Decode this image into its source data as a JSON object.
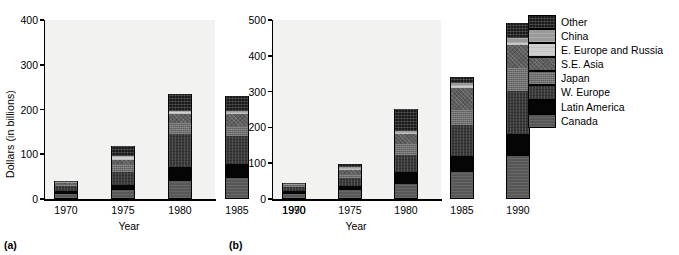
{
  "figure": {
    "background": "#ffffff",
    "panel_background": "#f2f2f0"
  },
  "legend": {
    "position": "right",
    "entries": [
      {
        "label": "Other",
        "key": "other",
        "color": "#1a1a1a"
      },
      {
        "label": "China",
        "key": "china",
        "color": "#9a9a9a"
      },
      {
        "label": "E. Europe and Russia",
        "key": "eeur",
        "color": "#cfcfcf"
      },
      {
        "label": "S.E. Asia",
        "key": "seasia",
        "color": "#5e5e5e"
      },
      {
        "label": "Japan",
        "key": "japan",
        "color": "#6e6e6e"
      },
      {
        "label": "W. Europe",
        "key": "weur",
        "color": "#3a3a3a"
      },
      {
        "label": "Latin America",
        "key": "latam",
        "color": "#050505"
      },
      {
        "label": "Canada",
        "key": "canada",
        "color": "#575757"
      }
    ]
  },
  "panels": [
    {
      "caption": "(a)"
    },
    {
      "caption": "(b)"
    }
  ],
  "chart_data": [
    {
      "type": "bar",
      "stacked": true,
      "panel": "(a)",
      "title": "",
      "xlabel": "Year",
      "ylabel": "Dollars (in billions)",
      "categories": [
        "1970",
        "1975",
        "1980",
        "1985",
        "1990"
      ],
      "yticks": [
        0,
        100,
        200,
        300,
        400
      ],
      "ylim": [
        0,
        400
      ],
      "grid": false,
      "totals": [
        38,
        116,
        233,
        227,
        390
      ],
      "series": [
        {
          "name": "Canada",
          "values": [
            8,
            18,
            37,
            45,
            78
          ]
        },
        {
          "name": "Latin America",
          "values": [
            7,
            10,
            33,
            30,
            43
          ]
        },
        {
          "name": "W. Europe",
          "values": [
            11,
            30,
            72,
            63,
            104
          ]
        },
        {
          "name": "Japan",
          "values": [
            5,
            17,
            25,
            22,
            48
          ]
        },
        {
          "name": "S.E. Asia",
          "values": [
            3,
            11,
            20,
            27,
            49
          ]
        },
        {
          "name": "E. Europe and Russia",
          "values": [
            1,
            5,
            5,
            4,
            4
          ]
        },
        {
          "name": "China",
          "values": [
            1,
            3,
            3,
            3,
            4
          ]
        },
        {
          "name": "Other",
          "values": [
            2,
            22,
            38,
            33,
            60
          ]
        }
      ]
    },
    {
      "type": "bar",
      "stacked": true,
      "panel": "(b)",
      "title": "",
      "xlabel": "Year",
      "ylabel": "Dollars (in billions)",
      "categories": [
        "1970",
        "1975",
        "1980",
        "1985",
        "1990"
      ],
      "yticks": [
        0,
        100,
        200,
        300,
        400,
        500
      ],
      "ylim": [
        0,
        500
      ],
      "grid": false,
      "totals": [
        42,
        94,
        249,
        338,
        489
      ],
      "series": [
        {
          "name": "Canada",
          "values": [
            10,
            22,
            38,
            72,
            117
          ]
        },
        {
          "name": "Latin America",
          "values": [
            10,
            12,
            35,
            45,
            63
          ]
        },
        {
          "name": "W. Europe",
          "values": [
            11,
            22,
            47,
            86,
            120
          ]
        },
        {
          "name": "Japan",
          "values": [
            4,
            12,
            30,
            44,
            64
          ]
        },
        {
          "name": "S.E. Asia",
          "values": [
            3,
            9,
            28,
            60,
            63
          ]
        },
        {
          "name": "E. Europe and Russia",
          "values": [
            1,
            5,
            5,
            5,
            5
          ]
        },
        {
          "name": "China",
          "values": [
            1,
            4,
            5,
            10,
            14
          ]
        },
        {
          "name": "Other",
          "values": [
            2,
            8,
            61,
            16,
            43
          ]
        }
      ]
    }
  ]
}
